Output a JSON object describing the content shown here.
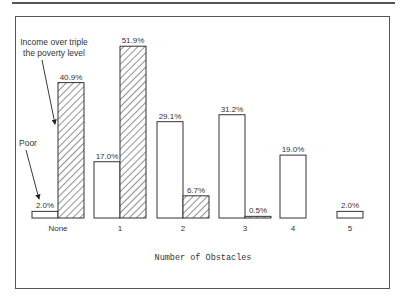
{
  "chart_data": {
    "type": "bar",
    "title": "",
    "xlabel": "Number of Obstacles",
    "ylabel": "",
    "categories": [
      "None",
      "1",
      "2",
      "3",
      "4",
      "5"
    ],
    "series": [
      {
        "name": "Poor",
        "pattern": "solid-white",
        "values": [
          2.0,
          17.0,
          29.1,
          31.2,
          19.0,
          2.0
        ],
        "labels": [
          "2.0%",
          "17.0%",
          "29.1%",
          "31.2%",
          "19.0%",
          "2.0%"
        ]
      },
      {
        "name": "Income over triple the poverty level",
        "pattern": "hatched",
        "values": [
          40.9,
          51.9,
          6.7,
          0.5,
          null,
          null
        ],
        "labels": [
          "40.9%",
          "51.9%",
          "6.7%",
          "0.5%",
          null,
          null
        ]
      }
    ],
    "annotations": [
      {
        "text": "Income over triple the poverty level",
        "lines": [
          "Income over triple",
          "the poverty level"
        ],
        "points_to": "None hatched bar"
      },
      {
        "text": "Poor",
        "points_to": "None white bar"
      }
    ],
    "grid": false,
    "legend": "arrow annotations",
    "ylim": [
      0,
      55
    ]
  },
  "annotation_rich_line1": "Income over triple",
  "annotation_rich_line2": "the poverty level",
  "annotation_poor": "Poor",
  "xlabel": "Number of Obstacles"
}
